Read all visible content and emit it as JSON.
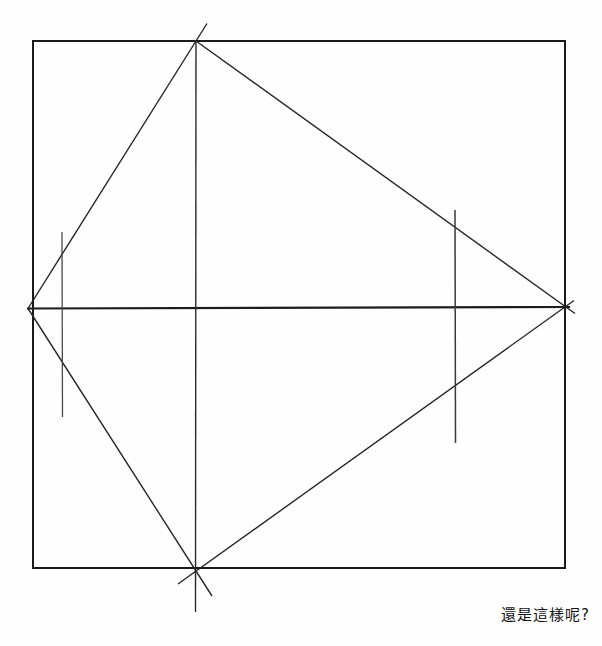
{
  "canvas": {
    "width": 602,
    "height": 646,
    "background": "#fefefe"
  },
  "diagram": {
    "border": {
      "name": "square-border",
      "x": 33,
      "y": 41,
      "width": 532,
      "height": 527,
      "stroke": "#1a1a1a",
      "stroke_width": 2
    },
    "lines": [
      {
        "name": "horizontal-midline",
        "x1": 27,
        "y1": 308.5,
        "x2": 570,
        "y2": 307,
        "width": 2.2,
        "color": "#1d1d1d"
      },
      {
        "name": "vertical-midline",
        "x1": 196,
        "y1": 41,
        "x2": 195.5,
        "y2": 612,
        "width": 1.4,
        "color": "#2a2a2a"
      },
      {
        "name": "kite-edge-left-top",
        "x1": 28,
        "y1": 308.5,
        "x2": 207,
        "y2": 23.5,
        "width": 1.4,
        "color": "#262626"
      },
      {
        "name": "kite-edge-top-right",
        "x1": 196,
        "y1": 41,
        "x2": 575,
        "y2": 313.5,
        "width": 1.4,
        "color": "#262626"
      },
      {
        "name": "kite-edge-right-bottom",
        "x1": 574,
        "y1": 300.5,
        "x2": 178,
        "y2": 584,
        "width": 1.4,
        "color": "#262626"
      },
      {
        "name": "kite-edge-left-bottom",
        "x1": 28,
        "y1": 308.5,
        "x2": 212,
        "y2": 596,
        "width": 1.4,
        "color": "#262626"
      },
      {
        "name": "left-tick-mark",
        "x1": 62,
        "y1": 232,
        "x2": 62.5,
        "y2": 417,
        "width": 1.3,
        "color": "#4a4a4a"
      },
      {
        "name": "right-tick-mark",
        "x1": 455,
        "y1": 210,
        "x2": 455.5,
        "y2": 443,
        "width": 1.5,
        "color": "#3a3a3a"
      }
    ]
  },
  "caption": {
    "text": "還是這樣呢?"
  }
}
